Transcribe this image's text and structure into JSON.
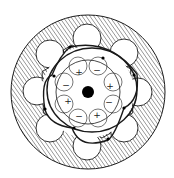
{
  "diagram": {
    "width": 174,
    "height": 178,
    "colors": {
      "background": "#ffffff",
      "stroke": "#1a1a1a",
      "hatch": "#555555",
      "dot": "#000000"
    },
    "outer_disk": {
      "cx": 88,
      "cy": 92,
      "r": 77
    },
    "center_dot": {
      "cx": 88,
      "cy": 92,
      "r": 6
    },
    "holes": [
      {
        "cx": 87,
        "cy": 38,
        "r": 14
      },
      {
        "cx": 124,
        "cy": 53,
        "r": 14
      },
      {
        "cx": 138,
        "cy": 92,
        "r": 14
      },
      {
        "cx": 124,
        "cy": 128,
        "r": 14
      },
      {
        "cx": 87,
        "cy": 146,
        "r": 14
      },
      {
        "cx": 50,
        "cy": 128,
        "r": 14
      },
      {
        "cx": 37,
        "cy": 91,
        "r": 14
      },
      {
        "cx": 50,
        "cy": 54,
        "r": 14
      }
    ],
    "rollers": [
      {
        "cx": 72,
        "cy": 55,
        "r": 10
      },
      {
        "cx": 104,
        "cy": 58,
        "r": 9
      },
      {
        "cx": 122,
        "cy": 74,
        "r": 10
      },
      {
        "cx": 124,
        "cy": 108,
        "r": 10
      },
      {
        "cx": 102,
        "cy": 128,
        "r": 10
      },
      {
        "cx": 52,
        "cy": 108,
        "r": 10
      },
      {
        "cx": 50,
        "cy": 76,
        "r": 9
      }
    ],
    "inner_ring": {
      "cx": 88,
      "cy": 92,
      "r": 32
    },
    "inner_arcs": [
      {
        "cx": 78,
        "cy": 66,
        "r": 9
      },
      {
        "cx": 98,
        "cy": 66,
        "r": 9
      },
      {
        "cx": 113,
        "cy": 82,
        "r": 9
      },
      {
        "cx": 113,
        "cy": 104,
        "r": 9
      },
      {
        "cx": 98,
        "cy": 118,
        "r": 9
      },
      {
        "cx": 78,
        "cy": 118,
        "r": 9
      },
      {
        "cx": 64,
        "cy": 104,
        "r": 9
      },
      {
        "cx": 64,
        "cy": 82,
        "r": 9
      }
    ],
    "signs": [
      {
        "x": 79,
        "y": 72,
        "label": "+"
      },
      {
        "x": 97,
        "y": 70,
        "label": "−"
      },
      {
        "x": 110,
        "y": 86,
        "label": "+"
      },
      {
        "x": 109,
        "y": 102,
        "label": "−"
      },
      {
        "x": 97,
        "y": 115,
        "label": "+"
      },
      {
        "x": 79,
        "y": 116,
        "label": "−"
      },
      {
        "x": 68,
        "y": 101,
        "label": "+"
      },
      {
        "x": 66,
        "y": 85,
        "label": "−"
      }
    ],
    "pentagon_path": "M70,47 Q110,38 137,74 Q140,100 124,108 Q115,135 108,140 Q80,150 72,128 Q50,125 45,110 Q40,80 52,75 Q60,55 70,47 Z",
    "ellipse_ring": {
      "cx": 92,
      "cy": 90,
      "rx": 45,
      "ry": 42
    },
    "nodes": [
      {
        "cx": 70,
        "cy": 47
      },
      {
        "cx": 103,
        "cy": 58
      },
      {
        "cx": 134,
        "cy": 75
      },
      {
        "cx": 124,
        "cy": 108
      },
      {
        "cx": 108,
        "cy": 139
      },
      {
        "cx": 74,
        "cy": 128
      },
      {
        "cx": 45,
        "cy": 109
      },
      {
        "cx": 54,
        "cy": 76
      }
    ]
  }
}
